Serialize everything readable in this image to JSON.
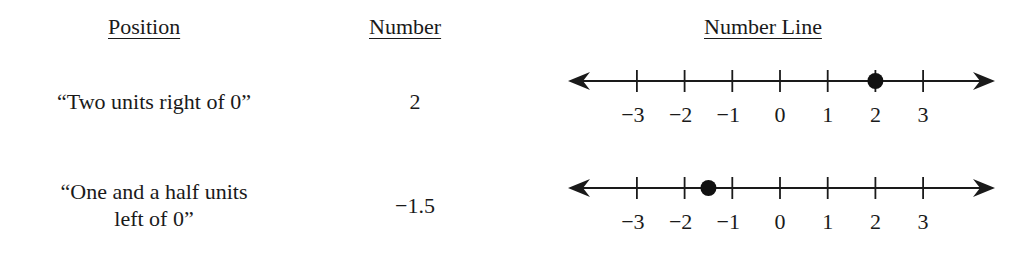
{
  "headers": {
    "position": "Position",
    "number": "Number",
    "number_line": "Number Line"
  },
  "rows": [
    {
      "position": "“Two units right of 0”",
      "position_lines": [
        "“Two units right of 0”"
      ],
      "number": "2",
      "point_value": 2
    },
    {
      "position": "“One and a half units left of 0”",
      "position_lines": [
        "“One and a half units",
        "left of 0”"
      ],
      "number": "−1.5",
      "point_value": -1.5
    }
  ],
  "number_line": {
    "ticks": [
      -3,
      -2,
      -1,
      0,
      1,
      2,
      3
    ],
    "tick_labels": [
      "−3",
      "−2",
      "−1",
      "0",
      "1",
      "2",
      "3"
    ],
    "arrows": "both-ends",
    "point_style": "filled-dot"
  },
  "chart_data": [
    {
      "type": "number-line",
      "title": "Number Line",
      "range": [
        -3,
        3
      ],
      "ticks": [
        -3,
        -2,
        -1,
        0,
        1,
        2,
        3
      ],
      "tick_labels": [
        "−3",
        "−2",
        "−1",
        "0",
        "1",
        "2",
        "3"
      ],
      "points": [
        2
      ],
      "label": "“Two units right of 0”",
      "number": "2"
    },
    {
      "type": "number-line",
      "title": "Number Line",
      "range": [
        -3,
        3
      ],
      "ticks": [
        -3,
        -2,
        -1,
        0,
        1,
        2,
        3
      ],
      "tick_labels": [
        "−3",
        "−2",
        "−1",
        "0",
        "1",
        "2",
        "3"
      ],
      "points": [
        -1.5
      ],
      "label": "“One and a half units left of 0”",
      "number": "−1.5"
    }
  ]
}
